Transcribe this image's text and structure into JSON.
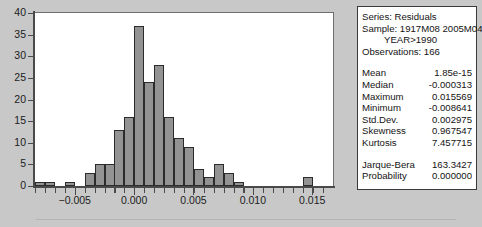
{
  "chart_data": {
    "type": "bar",
    "title": "",
    "xlabel": "",
    "ylabel": "",
    "ylim": [
      0,
      40
    ],
    "xlim": [
      -0.00835,
      0.01675
    ],
    "grid": false,
    "legend": null,
    "y_ticks": [
      0,
      5,
      10,
      15,
      20,
      25,
      30,
      35,
      40
    ],
    "y_tick_labels": [
      "0",
      "5",
      "10",
      "15",
      "20",
      "25",
      "30",
      "35",
      "40"
    ],
    "x_ticks": [
      -0.005,
      0.0,
      0.005,
      0.01,
      0.015
    ],
    "x_tick_labels": [
      "−0.005",
      "0.000",
      "0.005",
      "0.010",
      "0.015"
    ],
    "bin_width": 0.000837,
    "bin_centers": [
      -0.00793,
      -0.00709,
      -0.00626,
      -0.00542,
      -0.00458,
      -0.00375,
      -0.00291,
      -0.00207,
      -0.00124,
      -0.0004,
      0.00044,
      0.00127,
      0.00211,
      0.00295,
      0.00378,
      0.00462,
      0.00545,
      0.00629,
      0.00713,
      0.00796,
      0.0088,
      0.00963,
      0.01047,
      0.01131,
      0.01214,
      0.01298,
      0.01382,
      0.01465,
      0.01549
    ],
    "values": [
      1,
      1,
      0,
      1,
      0,
      3,
      5,
      5,
      13,
      16,
      37,
      24,
      28,
      16,
      11,
      9,
      4,
      2,
      5,
      3,
      1,
      0,
      0,
      0,
      0,
      0,
      0,
      2,
      0
    ],
    "bar_fill": "#939393",
    "bar_edge": "#2b2b2b"
  },
  "stats_box": {
    "series_line": "Series: Residuals",
    "sample_line": "Sample: 1917M08 2005M04 IF",
    "sample_line2": "YEAR>1990",
    "observations_line": "Observations: 166",
    "rows": [
      {
        "label": "Mean",
        "value": "1.85e-15"
      },
      {
        "label": "Median",
        "value": "-0.000313"
      },
      {
        "label": "Maximum",
        "value": "0.015569"
      },
      {
        "label": "Minimum",
        "value": "-0.008641"
      },
      {
        "label": "Std.Dev.",
        "value": "0.002975"
      },
      {
        "label": "Skewness",
        "value": "0.967547"
      },
      {
        "label": "Kurtosis",
        "value": "7.457715"
      }
    ],
    "test_rows": [
      {
        "label": "Jarque-Bera",
        "value": "163.3427"
      },
      {
        "label": "Probability",
        "value": "0.000000"
      }
    ]
  },
  "theme": {
    "page_background": "#c8c8c8",
    "plot_background": "#ffffff",
    "axis_color": "#4a4a4a",
    "text_color": "#141414"
  }
}
